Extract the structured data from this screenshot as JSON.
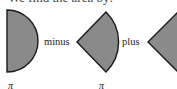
{
  "header": {
    "text": "We find the area by:"
  },
  "figure": {
    "fill_color": "#8a8a8a",
    "stroke_color": "#1a1a1a",
    "shapes": [
      {
        "name": "semicircle",
        "label_below": "π"
      },
      {
        "name": "circular-sector",
        "label_below": "π"
      },
      {
        "name": "triangle",
        "label_below": ""
      }
    ],
    "operators": [
      {
        "text": "minus"
      },
      {
        "text": "plus"
      }
    ]
  }
}
